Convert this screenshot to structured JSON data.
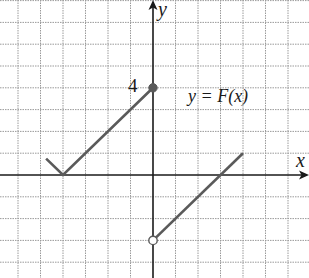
{
  "chart_data": {
    "type": "line",
    "title": "",
    "xlabel": "x",
    "ylabel": "y",
    "function_label": "y = F(x)",
    "tick_labels": [
      {
        "axis": "y",
        "value": 4,
        "text": "4"
      }
    ],
    "grid": true,
    "xlim": [
      -6.8,
      6.9
    ],
    "ylim": [
      -4.8,
      8
    ],
    "series": [
      {
        "name": "F(x) piece 1 (x <= 0)",
        "points": [
          [
            -4.75,
            0.75
          ],
          [
            -4,
            0
          ],
          [
            0,
            4
          ]
        ],
        "right_endpoint": {
          "x": 0,
          "y": 4,
          "style": "closed"
        }
      },
      {
        "name": "F(x) piece 2 (x > 0)",
        "points": [
          [
            0,
            -3
          ],
          [
            4,
            1
          ]
        ],
        "left_endpoint": {
          "x": 0,
          "y": -3,
          "style": "open"
        }
      }
    ],
    "colors": {
      "curve": "#5a5a5a",
      "axes": "#1a1a1a",
      "grid": "#9a9a9a"
    }
  },
  "labels": {
    "y_axis": "y",
    "x_axis": "x",
    "tick_4": "4",
    "function": "y = F(x)"
  }
}
